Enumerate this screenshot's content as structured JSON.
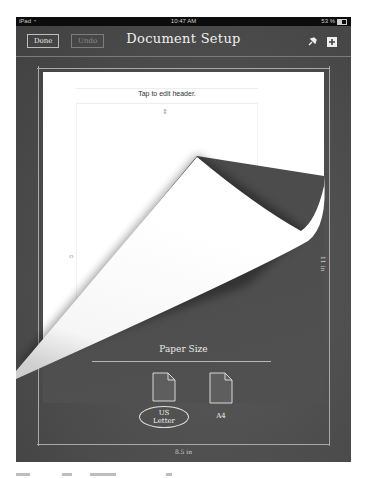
{
  "status_bar": {
    "device": "iPad",
    "wifi_icon": "wifi-icon",
    "time": "10:47 AM",
    "battery": "53 %",
    "battery_icon": "battery-icon"
  },
  "toolbar": {
    "done_label": "Done",
    "undo_label": "Undo",
    "title": "Document Setup",
    "icons": [
      "pin-icon",
      "add-icon"
    ]
  },
  "page": {
    "header_placeholder": "Tap to edit header.",
    "vertical_arrows": "⇕",
    "horizontal_arrows": "‹›"
  },
  "dimensions": {
    "height_label": "11 in",
    "width_label": "8.5 in"
  },
  "paper_size": {
    "title": "Paper Size",
    "options": [
      {
        "label": "US Letter",
        "selected": true
      },
      {
        "label": "A4",
        "selected": false
      }
    ]
  },
  "colors": {
    "board": "#4c4c4c",
    "status_bar": "#0c0c0c",
    "chalk": "#e8e8e8",
    "paper": "#ffffff"
  }
}
